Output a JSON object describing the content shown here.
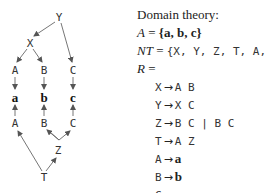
{
  "diagram": {
    "nodes": {
      "Y": "Y",
      "X": "X",
      "A_top": "A",
      "B_top": "B",
      "C_top": "C",
      "a": "a",
      "b": "b",
      "c": "c",
      "A_bottom": "A",
      "B_bottom": "B",
      "C_bottom": "C",
      "Z": "Z",
      "T": "T"
    },
    "edges": [
      {
        "from": "Y",
        "to": "X"
      },
      {
        "from": "Y",
        "to": "C_top"
      },
      {
        "from": "X",
        "to": "A_top"
      },
      {
        "from": "X",
        "to": "B_top"
      },
      {
        "from": "A_top",
        "to": "a"
      },
      {
        "from": "B_top",
        "to": "b"
      },
      {
        "from": "C_top",
        "to": "c"
      },
      {
        "from": "A_bottom",
        "to": "a"
      },
      {
        "from": "B_bottom",
        "to": "b"
      },
      {
        "from": "C_bottom",
        "to": "c"
      },
      {
        "from": "Z",
        "to": "B_bottom"
      },
      {
        "from": "Z",
        "to": "C_bottom"
      },
      {
        "from": "T",
        "to": "A_bottom"
      },
      {
        "from": "T",
        "to": "Z"
      }
    ]
  },
  "theory": {
    "title": "Domain theory:",
    "alphabet_label": "A",
    "eq": "=",
    "alphabet_value": "{a, b, c}",
    "nt_label": "NT",
    "nt_value": "{X, Y, Z, T, A, B, C}",
    "rules_label": "R",
    "arrow": "→",
    "rules": [
      {
        "lhs": "X",
        "rhs": "A B",
        "rhs_bold": false
      },
      {
        "lhs": "Y",
        "rhs": "X C",
        "rhs_bold": false
      },
      {
        "lhs": "Z",
        "rhs": "B C | B C",
        "rhs_bold": false
      },
      {
        "lhs": "T",
        "rhs": "A Z",
        "rhs_bold": false
      },
      {
        "lhs": "A",
        "rhs": "a",
        "rhs_bold": true
      },
      {
        "lhs": "B",
        "rhs": "b",
        "rhs_bold": true
      },
      {
        "lhs": "C",
        "rhs": "c",
        "rhs_bold": true
      }
    ]
  }
}
